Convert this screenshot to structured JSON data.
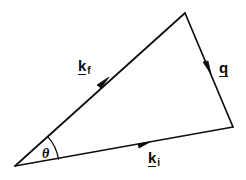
{
  "figure": {
    "name": "scattering-triangle",
    "background_color": "#ffffff",
    "stroke_color": "#0d0d0d",
    "width": 246,
    "height": 180
  },
  "geometry": {
    "origin_vertex": {
      "x": 15,
      "y": 166
    },
    "apex_vertex": {
      "x": 185,
      "y": 13
    },
    "right_vertex": {
      "x": 233,
      "y": 127
    },
    "arc": {
      "center": {
        "x": 15,
        "y": 166
      },
      "radius": 44,
      "start_angle_deg": -42,
      "end_angle_deg": -9
    }
  },
  "vectors": [
    {
      "id": "kf",
      "base": "k",
      "subscript": "f",
      "underlined": true,
      "from": {
        "x": 15,
        "y": 166
      },
      "to": {
        "x": 185,
        "y": 13
      },
      "arrow_at": {
        "x": 104,
        "y": 82
      },
      "label_pos": {
        "x": 78,
        "y": 58
      }
    },
    {
      "id": "q",
      "base": "q",
      "subscript": "",
      "underlined": true,
      "from": {
        "x": 185,
        "y": 13
      },
      "to": {
        "x": 233,
        "y": 127
      },
      "arrow_at": {
        "x": 208,
        "y": 68
      },
      "label_pos": {
        "x": 219,
        "y": 60
      }
    },
    {
      "id": "ki",
      "base": "k",
      "subscript": "i",
      "underlined": true,
      "from": {
        "x": 15,
        "y": 166
      },
      "to": {
        "x": 233,
        "y": 127
      },
      "arrow_at": {
        "x": 144,
        "y": 143
      },
      "label_pos": {
        "x": 148,
        "y": 150
      }
    }
  ],
  "labels": {
    "kf": {
      "base": "k",
      "sub": "f"
    },
    "q": {
      "base": "q",
      "sub": ""
    },
    "ki": {
      "base": "k",
      "sub": "i"
    },
    "theta": "θ"
  },
  "colors": {
    "ink": "#0d0d0d",
    "paper": "#ffffff"
  }
}
